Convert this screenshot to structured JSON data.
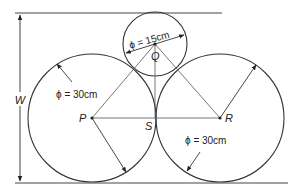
{
  "diagram": {
    "labels": {
      "width": "W",
      "small_diameter": "ϕ = 15cm",
      "left_diameter": "ϕ = 30cm",
      "right_diameter": "ϕ = 30cm",
      "point_p": "P",
      "point_q": "Q",
      "point_r": "R",
      "point_s": "S"
    },
    "colors": {
      "stroke": "#333333",
      "thin": "#555555"
    }
  }
}
